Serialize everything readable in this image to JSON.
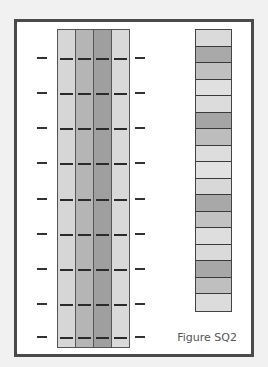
{
  "figure": {
    "caption": "Figure SQ2",
    "frame_border_color": "#4a4a4a",
    "background": "#ffffff"
  },
  "gel": {
    "lanes": [
      {
        "name": "lane-1",
        "color": "#d6d6d6"
      },
      {
        "name": "lane-2",
        "color": "#b5b5b5"
      },
      {
        "name": "lane-3",
        "color": "#9f9f9f"
      },
      {
        "name": "lane-4",
        "color": "#d9d9d9"
      }
    ],
    "band_rows_y": [
      35,
      70,
      105,
      140,
      176,
      211,
      246,
      281,
      314
    ],
    "band_color": "#2a2a2a"
  },
  "strip": {
    "segments": [
      "#dadada",
      "#a9a9a9",
      "#c0c0c0",
      "#e0e0e0",
      "#dcdcdc",
      "#a5a5a5",
      "#bdbdbd",
      "#dddddd",
      "#e2e2e2",
      "#d8d8d8",
      "#a8a8a8",
      "#c2c2c2",
      "#dedede",
      "#dadada",
      "#a7a7a7",
      "#bfbfbf",
      "#dcdcdc"
    ]
  }
}
